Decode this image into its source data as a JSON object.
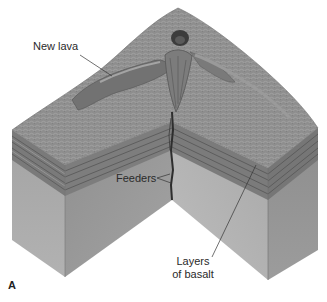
{
  "figure": {
    "panel_letter": "A",
    "labels": {
      "new_lava": "New lava",
      "feeders": "Feeders",
      "layers_of_basalt_line1": "Layers",
      "layers_of_basalt_line2": "of basalt"
    },
    "colors": {
      "surface": "#8c8c8c",
      "surface_light": "#a8a8a8",
      "lava": "#6e6e6e",
      "layers_dark": "#6a6a6a",
      "layers_light": "#8f8f8f",
      "block_left_front": "#a9a9a9",
      "block_left_inner": "#9c9c9c",
      "block_right_inner": "#b0b0b0",
      "block_right_front": "#989898",
      "feeder": "#2e2e2e",
      "leader_line": "#333333"
    }
  }
}
